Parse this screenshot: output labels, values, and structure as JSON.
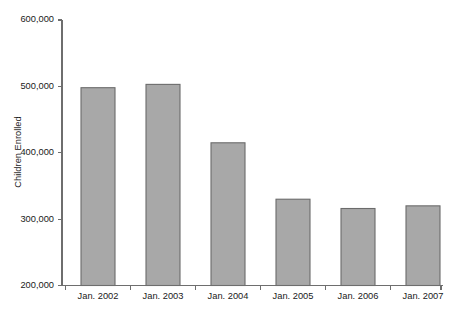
{
  "chart_data": {
    "type": "bar",
    "title": "",
    "subtitle": "",
    "xlabel": "",
    "ylabel": "Children Enrolled",
    "categories": [
      "Jan. 2002",
      "Jan. 2003",
      "Jan. 2004",
      "Jan. 2005",
      "Jan. 2006",
      "Jan. 2007"
    ],
    "values": [
      498000,
      503000,
      415000,
      330000,
      316000,
      320000
    ],
    "ylim": [
      200000,
      600000
    ],
    "yticks": [
      200000,
      300000,
      400000,
      500000,
      600000
    ],
    "ytick_labels": [
      "200,000",
      "300,000",
      "400,000",
      "500,000",
      "600,000"
    ],
    "grid": false,
    "legend": null,
    "bar_color": "#a8a8a8",
    "bar_border_color": "#6b6b6b",
    "axis_color": "#6e6e6e",
    "background_color": "#ffffff"
  }
}
